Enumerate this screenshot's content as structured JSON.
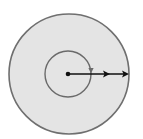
{
  "diagram": {
    "title": "",
    "background": "#ffffff",
    "outer_disk": {
      "cx": 69,
      "cy": 74,
      "r": 60,
      "fill": "#e4e4e4",
      "stroke": "#6f6f6f",
      "stroke_width": 1.6
    },
    "inner_circle": {
      "cx": 68,
      "cy": 74,
      "r": 23,
      "fill": "none",
      "stroke": "#6a6a6a",
      "stroke_width": 1.4
    },
    "rotation_arrow": {
      "x": 91,
      "y": 71,
      "direction": "clockwise",
      "color": "#6a6a6a"
    },
    "center_dot": {
      "cx": 68,
      "cy": 74,
      "r": 2.3,
      "color": "#111111"
    },
    "radial_line": {
      "x1": 68,
      "y1": 74,
      "x2": 129,
      "y2": 74,
      "color": "#111111",
      "stroke_width": 1.6
    },
    "arrowheads": [
      {
        "tip_x": 110,
        "y": 74
      },
      {
        "tip_x": 129,
        "y": 74
      }
    ]
  }
}
